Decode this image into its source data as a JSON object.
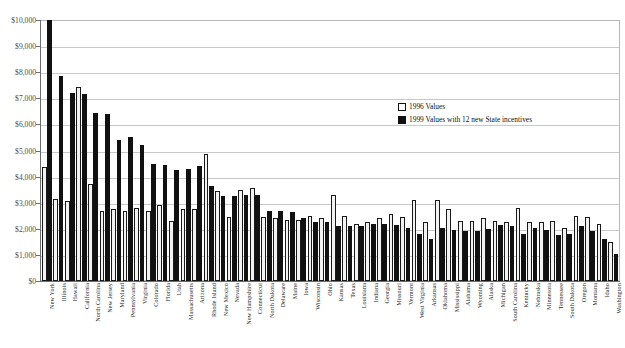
{
  "chart_data": {
    "type": "bar",
    "title": "",
    "xlabel": "",
    "ylabel": "",
    "ylim": [
      0,
      10000
    ],
    "ytick_labels": [
      "$10,000",
      "$9,000",
      "$8,000",
      "$7,000",
      "$6,000",
      "$5,000",
      "$4,000",
      "$3,000",
      "$2,000",
      "$1,000",
      "$0"
    ],
    "ytick_values": [
      10000,
      9000,
      8000,
      7000,
      6000,
      5000,
      4000,
      3000,
      2000,
      1000,
      0
    ],
    "grid": true,
    "legend_position": "upper-right",
    "categories": [
      "New York",
      "Illinois",
      "Hawaii",
      "California",
      "North Carolina",
      "New Jersey",
      "Maryland",
      "Pennsylvania",
      "Virginia",
      "Colorado",
      "Florida",
      "Utah",
      "Massachusetts",
      "Arizona",
      "Rhode Island",
      "New Mexico",
      "Nevada",
      "New Hampshire",
      "Connecticut",
      "North Dakota",
      "Delaware",
      "Maine",
      "Iowa",
      "Wisconsin",
      "Ohio",
      "Kansas",
      "Texas",
      "Louisiana",
      "Indiana",
      "Georgia",
      "Missouri",
      "Vermont",
      "West Virginia",
      "Arkansas",
      "Oklahoma",
      "Mississippi",
      "Alabama",
      "Wyoming",
      "Alaska",
      "Michigan",
      "South Carolina",
      "Kentucky",
      "Nebraska",
      "Minnesota",
      "Tennessee",
      "South Dakota",
      "Oregon",
      "Montana",
      "Idaho",
      "Washington"
    ],
    "series": [
      {
        "name": "1996 Values",
        "style": "open",
        "color": "#f2f2f2",
        "edge": "#1a1a1a",
        "values": [
          4350,
          3150,
          3050,
          7450,
          3700,
          2700,
          2750,
          2700,
          2800,
          2700,
          2900,
          2300,
          2750,
          2750,
          4850,
          3450,
          2450,
          3500,
          3550,
          2450,
          2400,
          2350,
          2350,
          2500,
          2400,
          3300,
          2500,
          2200,
          2250,
          2400,
          2550,
          2450,
          3100,
          2250,
          3100,
          2750,
          2300,
          2300,
          2400,
          2300,
          2250,
          2800,
          2250,
          2250,
          2300,
          2050,
          2500,
          2450,
          2200,
          1500
        ]
      },
      {
        "name": "1999 Values with 12 new State incentives",
        "style": "solid",
        "color": "#111111",
        "edge": "#111111",
        "values": [
          10000,
          7850,
          7200,
          7150,
          6450,
          6400,
          5400,
          5500,
          5200,
          4500,
          4450,
          4250,
          4300,
          4400,
          3650,
          3250,
          3250,
          3300,
          3300,
          2700,
          2700,
          2650,
          2400,
          2250,
          2250,
          2100,
          2100,
          2100,
          2200,
          2200,
          2150,
          2050,
          1800,
          1600,
          2050,
          1950,
          1900,
          1900,
          2000,
          2150,
          2100,
          1800,
          2050,
          1950,
          1750,
          1800,
          2100,
          1900,
          1600,
          1050
        ]
      }
    ]
  },
  "legend": {
    "entries": [
      {
        "label": "1996 Values"
      },
      {
        "label": "1999 Values with 12 new State incentives"
      }
    ]
  }
}
